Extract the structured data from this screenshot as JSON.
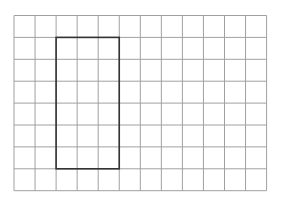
{
  "diagram": {
    "type": "grid-with-rectangle",
    "grid": {
      "columns": 12,
      "rows": 8,
      "origin_x": 14,
      "origin_y": 15.5,
      "cell_width": 21.05,
      "cell_height": 21.9,
      "line_color": "#a0a0a0",
      "line_width": 1
    },
    "rectangle": {
      "col_start": 2,
      "row_start": 1,
      "col_span": 3,
      "row_span": 6,
      "stroke_color": "#333333",
      "stroke_width": 1.6
    }
  }
}
